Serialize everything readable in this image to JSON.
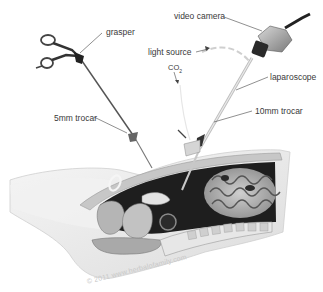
{
  "diagram": {
    "labels": {
      "grasper": "grasper",
      "video_camera": "video camera",
      "light_source": "light source",
      "co2": "CO",
      "co2_sub": "2",
      "laparoscope": "laparoscope",
      "trocar_5mm": "5mm trocar",
      "trocar_10mm": "10mm trocar"
    },
    "watermark": "© 2011 www.herbalofamily.com",
    "colors": {
      "label_text": "#3a3a3a",
      "leader_line": "#444444",
      "cavity_dark": "#1e1e1e",
      "tissue_light": "#d9d9d9",
      "tissue_mid": "#a8a8a8",
      "skin": "#eeeeee"
    }
  }
}
